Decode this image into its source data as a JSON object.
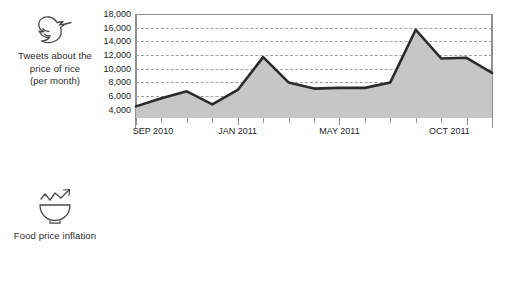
{
  "panels": [
    {
      "id": "tweets",
      "icon_name": "twitter-bird-icon",
      "caption_lines": [
        "Tweets about the",
        "price of rice",
        "(per month)"
      ]
    },
    {
      "id": "inflation",
      "icon_name": "rice-bowl-trend-icon",
      "caption_lines": [
        "Food price inflation"
      ]
    }
  ],
  "chart_data": [
    {
      "type": "area",
      "title": "Tweets about the price of rice (per month)",
      "xlabel": "",
      "ylabel": "Tweets about the price of rice (per month)",
      "ylim": [
        2800,
        18000
      ],
      "yticks": [
        4000,
        6000,
        8000,
        10000,
        12000,
        14000,
        16000,
        18000
      ],
      "ytick_labels": [
        "4,000",
        "6,000",
        "8,000",
        "10,000",
        "12,000",
        "14,000",
        "16,000",
        "18,000"
      ],
      "grid": true,
      "legend_position": "none",
      "fill_color": "#c6c6c6",
      "line_color": "#2b2b2b",
      "x": [
        "SEP 2010",
        "OCT 2010",
        "NOV 2010",
        "DEC 2010",
        "JAN 2011",
        "FEB 2011",
        "MAR 2011",
        "APR 2011",
        "MAY 2011",
        "JUN 2011",
        "JUL 2011",
        "AUG 2011",
        "SEP 2011",
        "OCT 2011"
      ],
      "xtick_labels": [
        "SEP 2010",
        "",
        "",
        "",
        "JAN 2011",
        "",
        "",
        "",
        "MAY 2011",
        "",
        "",
        "",
        "",
        "OCT 2011"
      ],
      "values": [
        4500,
        5700,
        6700,
        4800,
        6900,
        11700,
        8000,
        7100,
        7200,
        7200,
        8000,
        15700,
        11500,
        11600,
        9400
      ]
    },
    {
      "type": "line",
      "title": "Food price inflation",
      "xlabel": "",
      "ylabel": "Food price inflation",
      "ylim": [
        -3.6,
        3.0
      ],
      "yticks": [
        3,
        2,
        1,
        0,
        -1,
        -2,
        -3
      ],
      "ytick_labels": [
        "3",
        "2",
        "1",
        "0",
        "–1",
        "–2",
        "–3"
      ],
      "grid": true,
      "legend_position": "none",
      "line_color": "#3a3a3a",
      "x": [
        "SEP 2010",
        "OCT 2010",
        "NOV 2010",
        "DEC 2010",
        "JAN 2011",
        "FEB 2011",
        "MAR 2011",
        "APR 2011",
        "MAY 2011",
        "JUN 2011",
        "JUL 2011",
        "AUG 2011",
        "SEP 2011",
        "OCT 2011"
      ],
      "xtick_labels": [
        "SEP 2010",
        "",
        "",
        "",
        "JAN 2011",
        "",
        "",
        "",
        "MAY 2011",
        "",
        "",
        "",
        "",
        "OCT 2011"
      ],
      "values": [
        0.2,
        0.2,
        -1.8,
        1.4,
        2.7,
        2.4,
        1.0,
        -1.5,
        -2.9,
        -2.9,
        -0.4,
        1.0,
        1.3,
        0.3,
        -0.5
      ]
    }
  ]
}
